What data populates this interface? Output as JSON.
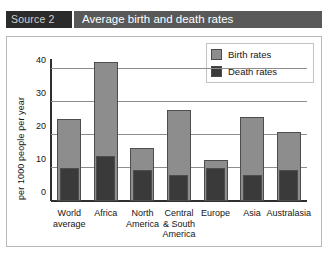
{
  "header": {
    "source_tag": "Source 2",
    "title": "Average birth and death rates"
  },
  "legend": {
    "items": [
      {
        "label": "Birth rates",
        "color": "#8d8d8d",
        "name": "legend-birth-rates"
      },
      {
        "label": "Death rates",
        "color": "#3a3a3a",
        "name": "legend-death-rates"
      }
    ]
  },
  "colors": {
    "birth": "#8d8d8d",
    "death": "#3a3a3a",
    "grid": "#8d8d8d",
    "axis": "#2f2f2f",
    "source_tag_bg": "#2b2b2b",
    "title_bg": "#595959",
    "frame_border": "#b9b9b9"
  },
  "chart_data": {
    "type": "bar",
    "title": "Average birth and death rates",
    "subtitle": "Source 2",
    "xlabel": "",
    "ylabel": "per 1000 people per year",
    "ylim": [
      0,
      45
    ],
    "yticks": [
      0,
      10,
      20,
      30,
      40
    ],
    "ytick_labels": [
      "0",
      "10",
      "20",
      "30",
      "40"
    ],
    "grid": true,
    "legend_position": "top-right",
    "categories": [
      "World\naverage",
      "Africa",
      "North\nAmerica",
      "Central\n& South\nAmerica",
      "Europe",
      "Asia",
      "Australasia"
    ],
    "series": [
      {
        "name": "Birth rates",
        "color": "#8d8d8d",
        "values": [
          25,
          42,
          16,
          27.5,
          12.5,
          25.5,
          21
        ]
      },
      {
        "name": "Death rates",
        "color": "#3a3a3a",
        "values": [
          10,
          13.5,
          9.5,
          8,
          10,
          8,
          9.5
        ]
      }
    ]
  }
}
